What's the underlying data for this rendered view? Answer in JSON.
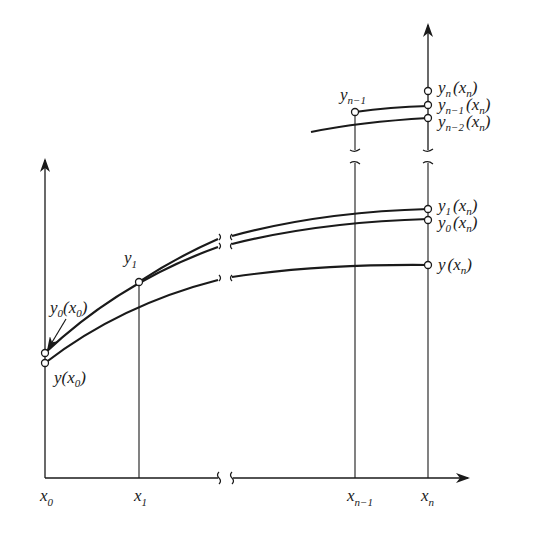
{
  "figure": {
    "type": "iteration-sequence-diagram",
    "x_axis": {
      "ticks": [
        {
          "id": "x0",
          "base": "x",
          "sub": "0"
        },
        {
          "id": "x1",
          "base": "x",
          "sub": "1"
        },
        {
          "id": "xn-1",
          "base": "x",
          "sub": "n−1"
        },
        {
          "id": "xn",
          "base": "x",
          "sub": "n"
        }
      ],
      "has_break": true
    },
    "y_axis": {
      "has_arrow": true
    },
    "curves": [
      {
        "id": "y-exact",
        "name": "y(x)"
      },
      {
        "id": "y0",
        "name": "y0(x)"
      },
      {
        "id": "y1",
        "name": "y1(x)"
      },
      {
        "id": "yn-2",
        "name": "yn−2(x)"
      },
      {
        "id": "yn-1",
        "name": "yn−1(x)"
      }
    ],
    "labels": {
      "y0_x0": {
        "base": "y",
        "sub": "0",
        "arg": "(x",
        "argsub": "0",
        "close": ")"
      },
      "y_x0": {
        "base": "y",
        "arg": "(x",
        "argsub": "0",
        "close": ")"
      },
      "y1_pt": {
        "base": "y",
        "sub": "1"
      },
      "yn1_pt": {
        "base": "y",
        "sub": "n−1"
      },
      "yn_xn": {
        "base": "y",
        "sub": "n",
        "arg": "(x",
        "argsub": "n",
        "close": ")"
      },
      "yn1_xn": {
        "base": "y",
        "sub": "n−1",
        "arg": "(x",
        "argsub": "n",
        "close": ")"
      },
      "yn2_xn": {
        "base": "y",
        "sub": "n−2",
        "arg": "(x",
        "argsub": "n",
        "close": ")"
      },
      "y1_xn": {
        "base": "y",
        "sub": "1",
        "arg": "(x",
        "argsub": "n",
        "close": ")"
      },
      "y0_xn": {
        "base": "y",
        "sub": "0",
        "arg": "(x",
        "argsub": "n",
        "close": ")"
      },
      "y_xn": {
        "base": "y",
        "arg": "(x",
        "argsub": "n",
        "close": ")"
      }
    },
    "colors": {
      "ink": "#1a1a1a",
      "background": "#ffffff"
    }
  }
}
